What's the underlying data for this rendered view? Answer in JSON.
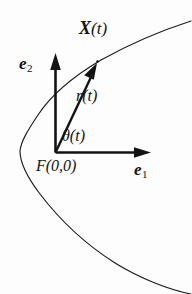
{
  "figure": {
    "background_color": "#fdfdfd",
    "ink_color": "#131313",
    "labels": {
      "point_label_symbol": "X",
      "point_label_arg": "(t)",
      "basis_2_symbol": "e",
      "basis_2_index": "2",
      "basis_1_symbol": "e",
      "basis_1_index": "1",
      "radius_label": "r(t)",
      "angle_label": "θ(t)",
      "focus_label": "F(0,0)"
    },
    "curve": {
      "name": "conic-section-branch",
      "type": "parabola-like-open-right",
      "stroke_width": 1.1
    },
    "arrows": [
      {
        "name": "e2-axis-arrow",
        "label": "e2"
      },
      {
        "name": "e1-axis-arrow",
        "label": "e1"
      },
      {
        "name": "radius-vector-arrow",
        "label": "r(t)"
      }
    ],
    "origin": {
      "x": 55,
      "y": 152,
      "label": "F(0,0)"
    },
    "point_on_curve": {
      "x": 97,
      "y": 62,
      "label": "X(t)"
    }
  }
}
